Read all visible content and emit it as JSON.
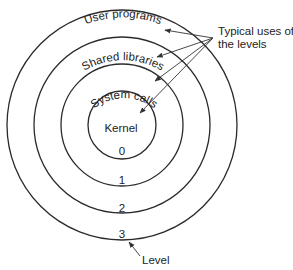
{
  "diagram": {
    "rings": [
      {
        "level": "0",
        "label": "Kernel"
      },
      {
        "level": "1",
        "label": "System calls"
      },
      {
        "level": "2",
        "label": "Shared libraries"
      },
      {
        "level": "3",
        "label": "User programs"
      }
    ],
    "annotation_uses_line1": "Typical uses of",
    "annotation_uses_line2": "the levels",
    "annotation_level": "Level"
  }
}
